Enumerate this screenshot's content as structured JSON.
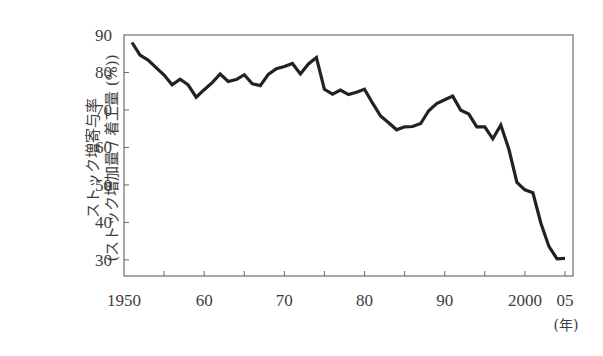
{
  "chart_data": {
    "type": "line",
    "title": "",
    "xlabel": "(年)",
    "ylabel_line1": "ストック増寄与率",
    "ylabel_line2": "(ストック増加量 / 着工量 (%))",
    "xlim": [
      1950,
      2006
    ],
    "ylim": [
      25.7,
      90
    ],
    "x_ticks": [
      1950,
      1955,
      1960,
      1965,
      1970,
      1975,
      1980,
      1985,
      1990,
      1995,
      2000,
      2005
    ],
    "x_tick_labels": [
      {
        "value": 1950,
        "label": "1950"
      },
      {
        "value": 1960,
        "label": "60"
      },
      {
        "value": 1970,
        "label": "70"
      },
      {
        "value": 1980,
        "label": "80"
      },
      {
        "value": 1990,
        "label": "90"
      },
      {
        "value": 2000,
        "label": "2000"
      },
      {
        "value": 2005,
        "label": "05"
      }
    ],
    "y_ticks": [
      30,
      40,
      50,
      60,
      70,
      80,
      90
    ],
    "y_tick_labels": [
      "30",
      "40",
      "50",
      "60",
      "70",
      "80",
      "90"
    ],
    "grid": false,
    "legend": "none",
    "line_color": "#222222",
    "series": [
      {
        "name": "ストック増寄与率",
        "x": [
          1951,
          1952,
          1953,
          1954,
          1955,
          1956,
          1957,
          1958,
          1959,
          1960,
          1961,
          1962,
          1963,
          1964,
          1965,
          1966,
          1967,
          1968,
          1969,
          1970,
          1971,
          1972,
          1973,
          1974,
          1975,
          1976,
          1977,
          1978,
          1979,
          1980,
          1981,
          1982,
          1983,
          1984,
          1985,
          1986,
          1987,
          1988,
          1989,
          1990,
          1991,
          1992,
          1993,
          1994,
          1995,
          1996,
          1997,
          1998,
          1999,
          2000,
          2001,
          2002,
          2003,
          2004,
          2005
        ],
        "values": [
          88.0,
          84.6,
          83.3,
          81.3,
          79.3,
          76.7,
          78.2,
          76.7,
          73.4,
          75.4,
          77.3,
          79.6,
          77.6,
          78.1,
          79.4,
          77.0,
          76.5,
          79.5,
          81.0,
          81.6,
          82.4,
          79.6,
          82.3,
          84.0,
          75.5,
          74.2,
          75.3,
          74.1,
          74.7,
          75.5,
          71.8,
          68.4,
          66.6,
          64.7,
          65.5,
          65.6,
          66.4,
          69.8,
          71.7,
          72.7,
          73.7,
          69.9,
          68.9,
          65.5,
          65.5,
          62.3,
          66.0,
          59.5,
          50.7,
          48.7,
          47.9,
          39.8,
          33.6,
          30.3,
          30.4
        ]
      }
    ]
  }
}
